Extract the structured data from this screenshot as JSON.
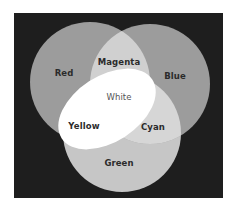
{
  "diagram": {
    "type": "venn-3-set-additive-color",
    "background_color": "#1e1e1e",
    "sets": [
      {
        "id": "red",
        "label": "Red",
        "fill": "#9c9c9c"
      },
      {
        "id": "blue",
        "label": "Blue",
        "fill": "#9c9c9c"
      },
      {
        "id": "green",
        "label": "Green",
        "fill": "#c6c6c6"
      }
    ],
    "intersections": [
      {
        "sets": [
          "red",
          "blue"
        ],
        "label": "Magenta",
        "fill": "#d0d0d0"
      },
      {
        "sets": [
          "blue",
          "green"
        ],
        "label": "Cyan",
        "fill": "#d6d6d6"
      },
      {
        "sets": [
          "red",
          "green"
        ],
        "label": "Yellow",
        "fill": "#ffffff"
      },
      {
        "sets": [
          "red",
          "blue",
          "green"
        ],
        "label": "White",
        "fill": "#ffffff"
      }
    ]
  },
  "labels": {
    "red": "Red",
    "blue": "Blue",
    "green": "Green",
    "magenta": "Magenta",
    "cyan": "Cyan",
    "yellow": "Yellow",
    "white": "White"
  }
}
